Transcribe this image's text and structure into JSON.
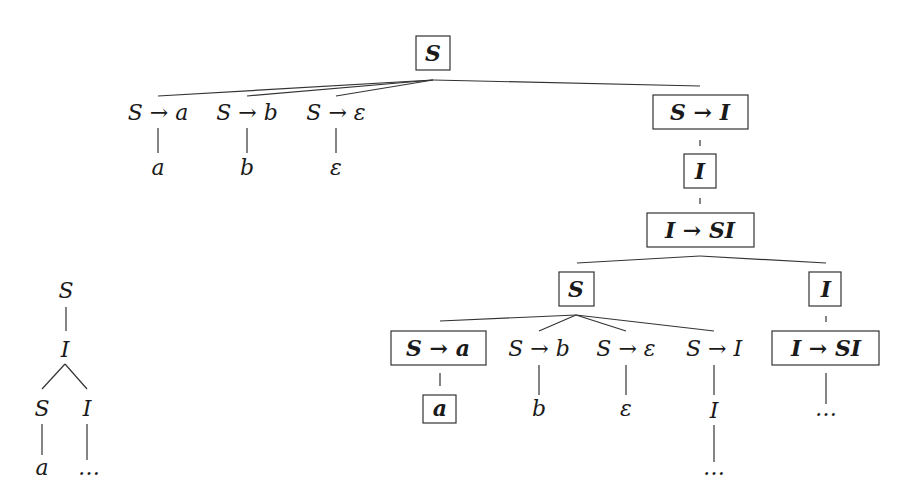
{
  "arrow": "→",
  "nodes": {
    "root": {
      "text": "S",
      "highlighted": true
    },
    "s_a": {
      "text": "S → a",
      "highlighted": false
    },
    "s_b": {
      "text": "S → b",
      "highlighted": false
    },
    "s_eps": {
      "text": "S → ε",
      "highlighted": false
    },
    "s_i": {
      "text": "S → I",
      "highlighted": true
    },
    "leaf_a": {
      "text": "a",
      "highlighted": false
    },
    "leaf_b": {
      "text": "b",
      "highlighted": false
    },
    "leaf_eps": {
      "text": "ε",
      "highlighted": false
    },
    "i1": {
      "text": "I",
      "highlighted": true
    },
    "i_si": {
      "text": "I → SI",
      "highlighted": true
    },
    "s2": {
      "text": "S",
      "highlighted": true
    },
    "i2": {
      "text": "I",
      "highlighted": true
    },
    "s2_a": {
      "text": "S → a",
      "highlighted": true
    },
    "s2_b": {
      "text": "S → b",
      "highlighted": false
    },
    "s2_eps": {
      "text": "S → ε",
      "highlighted": false
    },
    "s2_i": {
      "text": "S → I",
      "highlighted": false
    },
    "i2_si": {
      "text": "I → SI",
      "highlighted": true
    },
    "leaf2_a": {
      "text": "a",
      "highlighted": true
    },
    "leaf2_b": {
      "text": "b",
      "highlighted": false
    },
    "leaf2_eps": {
      "text": "ε",
      "highlighted": false
    },
    "leaf2_i": {
      "text": "I",
      "highlighted": false
    },
    "dots_i2": {
      "text": "…",
      "highlighted": false
    },
    "dots_s2i": {
      "text": "…",
      "highlighted": false
    }
  },
  "small_tree": {
    "nodes": {
      "s": {
        "text": "S"
      },
      "i": {
        "text": "I"
      },
      "s_child": {
        "text": "S"
      },
      "i_child": {
        "text": "I"
      },
      "a": {
        "text": "a"
      },
      "dots": {
        "text": "…"
      }
    }
  }
}
